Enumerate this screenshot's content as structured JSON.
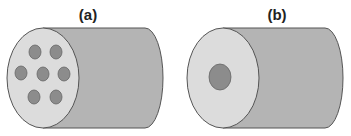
{
  "panels": [
    {
      "label": "(a)",
      "description": "cylinder with seven holes",
      "hole_count": 7
    },
    {
      "label": "(b)",
      "description": "cylinder with single central hole",
      "hole_count": 1
    }
  ],
  "colors": {
    "face": "#dcdcdc",
    "body": "#b4b4b4",
    "hole": "#8c8c8c",
    "outline": "#555555"
  }
}
